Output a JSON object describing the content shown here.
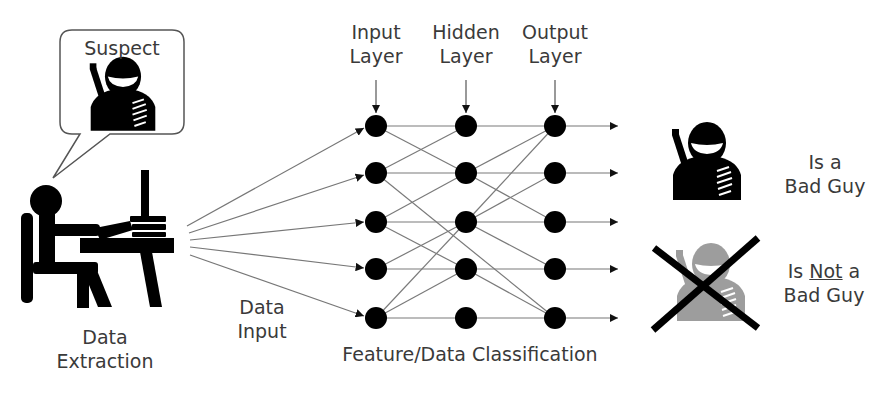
{
  "speech_bubble": {
    "label": "Suspect",
    "icon": "suspect-icon"
  },
  "left": {
    "icon": "person-at-computer-icon",
    "caption_line1": "Data",
    "caption_line2": "Extraction"
  },
  "data_input": {
    "line1": "Data",
    "line2": "Input"
  },
  "network": {
    "layers": [
      {
        "line1": "Input",
        "line2": "Layer"
      },
      {
        "line1": "Hidden",
        "line2": "Layer"
      },
      {
        "line1": "Output",
        "line2": "Layer"
      }
    ],
    "nodes_per_layer": 5,
    "caption": "Feature/Data Classification",
    "node_color": "#000000",
    "edge_color": "#7a7a7a"
  },
  "results": {
    "positive": {
      "line1": "Is a",
      "line2": "Bad Guy",
      "icon": "suspect-icon"
    },
    "negative": {
      "line1_pre": "Is ",
      "line1_underlined": "Not",
      "line1_post": " a",
      "line2": "Bad Guy",
      "icon": "suspect-crossed-out-icon",
      "icon_color": "#a0a0a0"
    }
  }
}
